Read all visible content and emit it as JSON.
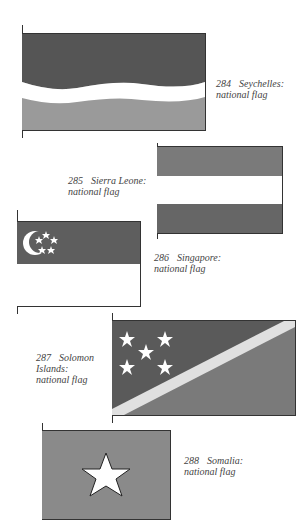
{
  "flags": [
    {
      "number": "284",
      "name": "Seychelles:",
      "desc": "national flag",
      "colors": {
        "top": "#555555",
        "middle": "#ffffff",
        "bottom": "#9a9a9a"
      }
    },
    {
      "number": "285",
      "name": "Sierra Leone:",
      "desc": "national flag",
      "colors": {
        "top": "#7a7a7a",
        "middle": "#ffffff",
        "bottom": "#666666"
      }
    },
    {
      "number": "286",
      "name": "Singapore:",
      "desc": "national flag",
      "colors": {
        "top": "#5e5e5e",
        "bottom": "#ffffff",
        "emblem": "#ffffff"
      }
    },
    {
      "number": "287",
      "name": "Solomon",
      "name2": "Islands:",
      "desc": "national flag",
      "colors": {
        "upper": "#5a5a5a",
        "lower": "#7a7a7a",
        "stripe": "#e0e0e0",
        "stars": "#ffffff"
      }
    },
    {
      "number": "288",
      "name": "Somalia:",
      "desc": "national flag",
      "colors": {
        "field": "#8a8a8a",
        "star": "#ffffff"
      }
    }
  ]
}
